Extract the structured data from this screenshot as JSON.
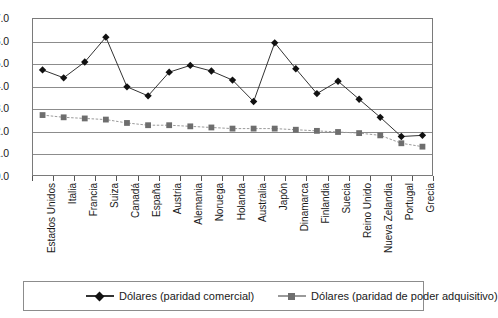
{
  "chart_data": {
    "type": "line",
    "title": "",
    "subtitle": "",
    "xlabel": "",
    "ylabel": "",
    "ylim": [
      0.0,
      7.0
    ],
    "ytick_step": 1.0,
    "grid": true,
    "legend_position": "bottom",
    "categories": [
      "Estados Unidos",
      "Italia",
      "Francia",
      "Suiza",
      "Canadá",
      "España",
      "Austria",
      "Alemania",
      "Noruega",
      "Holanda",
      "Australia",
      "Japón",
      "Dinamarca",
      "Finlandia",
      "Suecia",
      "Reino Unido",
      "Nueva Zelandia",
      "Portugal",
      "Grecia"
    ],
    "ytick_labels": [
      "0.0",
      "1.0",
      "2.0",
      "3.0",
      "4.0",
      "5.0",
      "6.0",
      "7.0"
    ],
    "ytick_values": [
      0.0,
      1.0,
      2.0,
      3.0,
      4.0,
      5.0,
      6.0,
      7.0
    ],
    "series": [
      {
        "name": "Dólares (paridad comercial)",
        "marker": "diamond",
        "color": "#111111",
        "line_color": "#333333",
        "values": [
          4.7,
          4.35,
          5.05,
          6.15,
          3.95,
          3.55,
          4.6,
          4.9,
          4.65,
          4.25,
          3.3,
          5.9,
          4.75,
          3.65,
          4.2,
          3.4,
          2.6,
          1.75,
          1.8
        ]
      },
      {
        "name": "Dólares (paridad de poder adquisitivo)",
        "marker": "square",
        "color": "#6e6e6e",
        "line_color": "#9a9a9a",
        "values": [
          2.7,
          2.6,
          2.55,
          2.5,
          2.35,
          2.25,
          2.25,
          2.2,
          2.15,
          2.1,
          2.1,
          2.1,
          2.05,
          2.0,
          1.95,
          1.9,
          1.8,
          1.45,
          1.3
        ]
      }
    ]
  },
  "legend": {
    "items": [
      {
        "label": "Dólares (paridad comercial)",
        "marker": "diamond-marker-icon"
      },
      {
        "label": "Dólares (paridad de poder adquisitivo)",
        "marker": "square-marker-icon"
      }
    ]
  },
  "colors": {
    "series1": "#111111",
    "series2": "#6e6e6e",
    "grid": "#8c8c8c",
    "frame": "#7a7a7a",
    "background": "#ffffff",
    "text": "#1a1a1a"
  }
}
